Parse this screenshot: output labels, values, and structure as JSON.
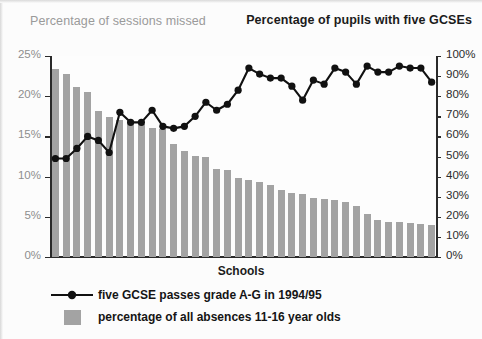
{
  "titles": {
    "left": "Percentage of sessions missed",
    "right": "Percentage of pupils with five GCSEs",
    "xaxis": "Schools"
  },
  "legend": [
    {
      "key": "line-marker",
      "label": "five GCSE passes grade A-G in 1994/95"
    },
    {
      "key": "gray-swatch",
      "label": "percentage of all absences 11-16 year olds"
    }
  ],
  "colors": {
    "bar": "#a3a3a3",
    "line": "#111111",
    "axis": "#2a2a2a",
    "left_label": "#8e8e8e",
    "right_label": "#2b2b2b",
    "background": "#fcfcfc"
  },
  "chart_data": {
    "type": "bar",
    "xlabel": "Schools",
    "grid": false,
    "legend_position": "bottom-left",
    "categories": [
      "1",
      "2",
      "3",
      "4",
      "5",
      "6",
      "7",
      "8",
      "9",
      "10",
      "11",
      "12",
      "13",
      "14",
      "15",
      "16",
      "17",
      "18",
      "19",
      "20",
      "21",
      "22",
      "23",
      "24",
      "25",
      "26",
      "27",
      "28",
      "29",
      "30",
      "31",
      "32",
      "33",
      "34",
      "35",
      "36"
    ],
    "axes": {
      "left": {
        "label": "Percentage of sessions missed",
        "ylim": [
          0,
          25
        ],
        "ticks": [
          0,
          5,
          10,
          15,
          20,
          25
        ],
        "ticklabels": [
          "0%",
          "5%",
          "10%",
          "15%",
          "20%",
          "25%"
        ]
      },
      "right": {
        "label": "Percentage of pupils with five GCSEs",
        "ylim": [
          0,
          100
        ],
        "ticks": [
          0,
          10,
          20,
          30,
          40,
          50,
          60,
          70,
          80,
          90,
          100
        ],
        "ticklabels": [
          "0%",
          "10%",
          "20%",
          "30%",
          "40%",
          "50%",
          "60%",
          "70%",
          "80%",
          "90%",
          "100%"
        ]
      }
    },
    "series": [
      {
        "name": "percentage of all absences 11-16 year olds",
        "type": "bar",
        "axis": "left",
        "unit": "%",
        "values": [
          23.4,
          22.8,
          21.2,
          20.5,
          18.2,
          17.4,
          17.1,
          16.9,
          16.6,
          16.1,
          15.9,
          14.0,
          13.2,
          12.6,
          12.4,
          11.0,
          10.8,
          9.8,
          9.6,
          9.3,
          8.9,
          8.3,
          8.0,
          7.8,
          7.4,
          7.2,
          7.1,
          6.9,
          6.3,
          5.4,
          4.6,
          4.4,
          4.3,
          4.2,
          4.1,
          4.0
        ]
      },
      {
        "name": "five GCSE passes grade A-G in 1994/95",
        "type": "line",
        "axis": "right",
        "unit": "%",
        "marker": "circle",
        "values": [
          49,
          49,
          54,
          60,
          58,
          52,
          72,
          67,
          67,
          73,
          65,
          64,
          65,
          70,
          77,
          73,
          76,
          83,
          94,
          91,
          89,
          89,
          85,
          78,
          88,
          86,
          94,
          92,
          86,
          95,
          92,
          92,
          95,
          94,
          94,
          87
        ]
      }
    ]
  }
}
